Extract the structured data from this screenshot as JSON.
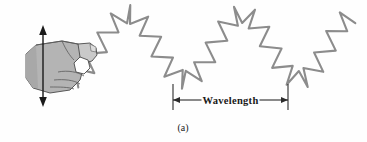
{
  "figure": {
    "caption": "(a)",
    "background_color": "#fefefe",
    "width": 367,
    "height": 142
  },
  "labels": {
    "wavelength": "Wavelength"
  },
  "colors": {
    "spring_stroke": "#8c8c8c",
    "spring_stroke_dark": "#7a7a7a",
    "hand_fill": "#b4b4b4",
    "hand_fill_light": "#c9c9c9",
    "hand_outline": "#4a4a4a",
    "arrow_black": "#1a1a1a",
    "measure_line": "#2b2b2b",
    "text": "#1a1a1a"
  },
  "chart_data": {
    "type": "line",
    "title": "",
    "subtitle": "",
    "xlabel": "",
    "ylabel": "",
    "waveform": {
      "shape": "sinusoid",
      "baseline_y": 47,
      "amplitude": 33,
      "wavelength_px": 114,
      "phase_start_x": 75,
      "end_x": 352,
      "coil_count": 46,
      "coil_half_width": 9
    },
    "features": [
      {
        "name": "spring-origin",
        "x": 75,
        "y": 55
      },
      {
        "name": "crest-1",
        "x": 128,
        "y": 15
      },
      {
        "name": "trough-1",
        "x": 174,
        "y": 80
      },
      {
        "name": "crest-2",
        "x": 232,
        "y": 14
      },
      {
        "name": "trough-2",
        "x": 288,
        "y": 80
      },
      {
        "name": "spring-end",
        "x": 351,
        "y": 25
      }
    ],
    "annotations": [
      {
        "name": "wavelength-measure",
        "text": "Wavelength",
        "x_start": 173,
        "x_end": 288,
        "y": 100,
        "span_px": 115,
        "meaning": "one full wavelength, trough to trough"
      },
      {
        "name": "hand-motion-arrow",
        "text": "",
        "x": 43,
        "y_top": 27,
        "y_bottom": 105,
        "direction": "vertical-double-headed",
        "meaning": "hand shakes up and down perpendicular to wave travel"
      }
    ]
  },
  "icons": {
    "hand": "hand-gripping-icon",
    "spring": "coiled-spring-icon",
    "motion_arrow": "double-arrow-vertical-icon",
    "measure_arrow": "double-arrow-horizontal-icon"
  }
}
